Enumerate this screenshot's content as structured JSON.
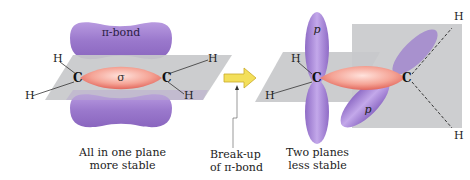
{
  "left_molecule": {
    "pi_label": "π-bond",
    "sigma_label": "σ",
    "carbons": [
      "C",
      "C"
    ],
    "hydrogens": [
      "H",
      "H",
      "H",
      "H"
    ],
    "caption_line1": "All in one plane",
    "caption_line2": "more stable"
  },
  "arrow": {
    "caption_line1": "Break-up",
    "caption_line2": "of π-bond"
  },
  "right_molecule": {
    "p_label_top": "p",
    "p_label_bottom": "p",
    "carbons": [
      "C",
      "C"
    ],
    "hydrogens": [
      "H",
      "H",
      "H",
      "H"
    ],
    "caption_line1": "Two planes",
    "caption_line2": "less stable"
  },
  "colors": {
    "pi_lobe": "#a07fd0",
    "sigma": "#f08a80",
    "plane": "#c8c9cb",
    "arrow": "#f3df5a"
  }
}
